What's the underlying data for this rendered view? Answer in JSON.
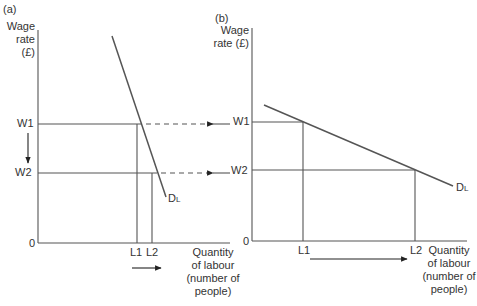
{
  "panels": [
    {
      "id": "a",
      "label": "(a)",
      "y_axis_title_line1": "Wage",
      "y_axis_title_line2": "rate (£)",
      "origin": "0",
      "w1": "W1",
      "w2": "W2",
      "l1": "L1",
      "l2": "L2",
      "curve_main": "D",
      "curve_sub": "L",
      "x_axis_title": [
        "Quantity",
        "of labour",
        "(number of",
        "people)"
      ]
    },
    {
      "id": "b",
      "label": "(b)",
      "y_axis_title_line1": "Wage",
      "y_axis_title_line2": "rate (£)",
      "origin": "0",
      "w1": "W1",
      "w2": "W2",
      "l1": "L1",
      "l2": "L2",
      "curve_main": "D",
      "curve_sub": "L",
      "x_axis_title": [
        "Quantity",
        "of labour",
        "(number of",
        "people)"
      ]
    }
  ],
  "diagram": {
    "line_color": "#555555",
    "panel_a": {
      "demand_curve": {
        "from": [
          112,
          36
        ],
        "to": [
          165,
          196
        ]
      },
      "w1_y": 124,
      "w2_y": 173,
      "l1_x": 137,
      "l2_x": 152
    },
    "panel_b": {
      "demand_curve": {
        "from": [
          264,
          105
        ],
        "to": [
          453,
          186
        ]
      },
      "w1_y": 122,
      "w2_y": 170,
      "l1_x": 303,
      "l2_x": 415
    }
  }
}
